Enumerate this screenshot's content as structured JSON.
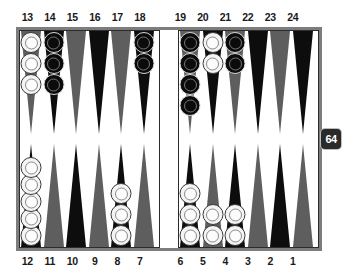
{
  "board": {
    "title": "Backgammon Board Position",
    "labels": {
      "top_left": [
        "13",
        "14",
        "15",
        "16",
        "17",
        "18"
      ],
      "top_right": [
        "19",
        "20",
        "21",
        "22",
        "23",
        "24"
      ],
      "bottom_left": [
        "12",
        "11",
        "10",
        "9",
        "8",
        "7"
      ],
      "bottom_right": [
        "6",
        "5",
        "4",
        "3",
        "2",
        "1"
      ]
    },
    "colors": {
      "frame": "#7d7d7d",
      "board_background": "#ffffff",
      "point_light": "#5e5e5e",
      "point_dark": "#0d0d0d",
      "checker_white": "#f4f4f4",
      "checker_black": "#0b0b0b",
      "cube_background": "#2a2a2a",
      "cube_text": "#ffffff"
    },
    "quadrants": {
      "top_left": [
        {
          "point": "13",
          "triangle": "light",
          "checker_color": "white",
          "count": 3
        },
        {
          "point": "14",
          "triangle": "dark",
          "checker_color": "black",
          "count": 3
        },
        {
          "point": "15",
          "triangle": "light",
          "checker_color": "none",
          "count": 0
        },
        {
          "point": "16",
          "triangle": "dark",
          "checker_color": "none",
          "count": 0
        },
        {
          "point": "17",
          "triangle": "light",
          "checker_color": "none",
          "count": 0
        },
        {
          "point": "18",
          "triangle": "dark",
          "checker_color": "black",
          "count": 2
        }
      ],
      "top_right": [
        {
          "point": "19",
          "triangle": "light",
          "checker_color": "black",
          "count": 4
        },
        {
          "point": "20",
          "triangle": "dark",
          "checker_color": "white",
          "count": 2
        },
        {
          "point": "21",
          "triangle": "light",
          "checker_color": "black",
          "count": 2
        },
        {
          "point": "22",
          "triangle": "dark",
          "checker_color": "none",
          "count": 0
        },
        {
          "point": "23",
          "triangle": "light",
          "checker_color": "none",
          "count": 0
        },
        {
          "point": "24",
          "triangle": "dark",
          "checker_color": "none",
          "count": 0
        }
      ],
      "bottom_left": [
        {
          "point": "12",
          "triangle": "dark",
          "checker_color": "white",
          "count": 5,
          "tight": true
        },
        {
          "point": "11",
          "triangle": "light",
          "checker_color": "none",
          "count": 0
        },
        {
          "point": "10",
          "triangle": "dark",
          "checker_color": "none",
          "count": 0
        },
        {
          "point": "9",
          "triangle": "light",
          "checker_color": "none",
          "count": 0
        },
        {
          "point": "8",
          "triangle": "dark",
          "checker_color": "white",
          "count": 3
        },
        {
          "point": "7",
          "triangle": "light",
          "checker_color": "none",
          "count": 0
        }
      ],
      "bottom_right": [
        {
          "point": "6",
          "triangle": "dark",
          "checker_color": "white",
          "count": 3
        },
        {
          "point": "5",
          "triangle": "light",
          "checker_color": "white",
          "count": 2
        },
        {
          "point": "4",
          "triangle": "dark",
          "checker_color": "white",
          "count": 2
        },
        {
          "point": "3",
          "triangle": "light",
          "checker_color": "none",
          "count": 0
        },
        {
          "point": "2",
          "triangle": "dark",
          "checker_color": "none",
          "count": 0
        },
        {
          "point": "1",
          "triangle": "light",
          "checker_color": "none",
          "count": 0
        }
      ]
    },
    "doubling_cube": {
      "value": "64"
    }
  }
}
